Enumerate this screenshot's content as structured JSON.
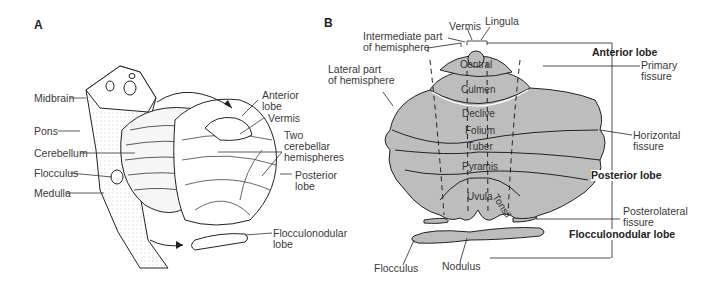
{
  "figure": {
    "panel_a": {
      "letter": "A",
      "labels": {
        "midbrain": "Midbrain",
        "pons": "Pons",
        "cerebellum": "Cerebellum",
        "flocculus": "Flocculus",
        "medulla": "Medulla",
        "anterior_lobe_1": "Anterior",
        "anterior_lobe_2": "lobe",
        "vermis": "Vermis",
        "hemispheres_1": "Two",
        "hemispheres_2": "cerebellar",
        "hemispheres_3": "hemispheres",
        "posterior_lobe_1": "Posterior",
        "posterior_lobe_2": "lobe",
        "flocculonodular_1": "Flocculonodular",
        "flocculonodular_2": "lobe"
      }
    },
    "panel_b": {
      "letter": "B",
      "labels": {
        "intermediate_1": "Intermediate part",
        "intermediate_2": "of hemisphere",
        "vermis": "Vermis",
        "lingula": "Lingula",
        "lateral_1": "Lateral part",
        "lateral_2": "of hemisphere",
        "central": "Central",
        "culmen": "Culmen",
        "declive": "Declive",
        "folium": "Folium",
        "tuber": "Tuber",
        "pyramis": "Pyramis",
        "uvula": "Uvula",
        "tonsil": "Tonsil",
        "anterior_lobe": "Anterior lobe",
        "primary_fissure_1": "Primary",
        "primary_fissure_2": "fissure",
        "horizontal_fissure_1": "Horizontal",
        "horizontal_fissure_2": "fissure",
        "posterior_lobe": "Posterior lobe",
        "posterolateral_1": "Posterolateral",
        "posterolateral_2": "fissure",
        "flocculonodular_lobe": "Flocculonodular lobe",
        "flocculus": "Flocculus",
        "nodulus": "Nodulus"
      }
    },
    "colors": {
      "lobe_fill": "#bdbdbd",
      "outline": "#222222",
      "text": "#3a3a3a"
    }
  }
}
